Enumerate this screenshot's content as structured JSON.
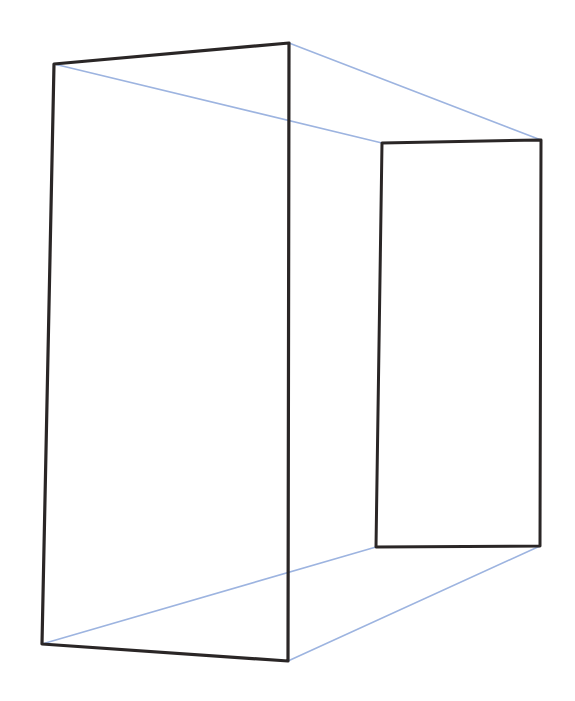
{
  "figure": {
    "colors": {
      "background": "#ffffff",
      "face_edge": "#2a2626",
      "connector_edge": "#9db4e0"
    },
    "front_face": {
      "top_left": [
        54,
        64
      ],
      "top_right": [
        289,
        43
      ],
      "bottom_right": [
        288,
        661
      ],
      "bottom_left": [
        42,
        644
      ]
    },
    "back_face": {
      "top_left": [
        382,
        143
      ],
      "top_right": [
        541,
        140
      ],
      "bottom_right": [
        540,
        546
      ],
      "bottom_left": [
        376,
        547
      ]
    },
    "connectors": [
      {
        "from": "front_face.top_left",
        "to": "back_face.top_left"
      },
      {
        "from": "front_face.top_right",
        "to": "back_face.top_right"
      },
      {
        "from": "front_face.bottom_left",
        "to": "back_face.bottom_left"
      },
      {
        "from": "front_face.bottom_right",
        "to": "back_face.bottom_right"
      }
    ]
  }
}
